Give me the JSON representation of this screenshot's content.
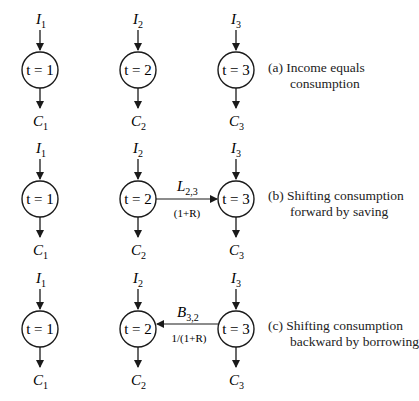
{
  "diagram": {
    "colors": {
      "stroke": "#1a1a1a",
      "background": "#ffffff"
    },
    "panels": [
      {
        "id": "a",
        "caption_line1": "(a) Income equals",
        "caption_line2": "consumption",
        "nodes": [
          {
            "income": "I",
            "income_sub": "1",
            "period": "t = 1",
            "consumption": "C",
            "consumption_sub": "1"
          },
          {
            "income": "I",
            "income_sub": "2",
            "period": "t = 2",
            "consumption": "C",
            "consumption_sub": "2"
          },
          {
            "income": "I",
            "income_sub": "3",
            "period": "t = 3",
            "consumption": "C",
            "consumption_sub": "3"
          }
        ]
      },
      {
        "id": "b",
        "caption_line1": "(b) Shifting consumption",
        "caption_line2": "forward by saving",
        "nodes": [
          {
            "income": "I",
            "income_sub": "1",
            "period": "t = 1",
            "consumption": "C",
            "consumption_sub": "1"
          },
          {
            "income": "I",
            "income_sub": "2",
            "period": "t = 2",
            "consumption": "C",
            "consumption_sub": "2"
          },
          {
            "income": "I",
            "income_sub": "3",
            "period": "t = 3",
            "consumption": "C",
            "consumption_sub": "3"
          }
        ],
        "edge": {
          "from": "t=2",
          "to": "t=3",
          "label": "L",
          "label_sub": "2,3",
          "factor": "(1+R)"
        }
      },
      {
        "id": "c",
        "caption_line1": "(c) Shifting consumption",
        "caption_line2": "backward by borrowing",
        "nodes": [
          {
            "income": "I",
            "income_sub": "1",
            "period": "t = 1",
            "consumption": "C",
            "consumption_sub": "1"
          },
          {
            "income": "I",
            "income_sub": "2",
            "period": "t = 2",
            "consumption": "C",
            "consumption_sub": "2"
          },
          {
            "income": "I",
            "income_sub": "3",
            "period": "t = 3",
            "consumption": "C",
            "consumption_sub": "3"
          }
        ],
        "edge": {
          "from": "t=3",
          "to": "t=2",
          "label": "B",
          "label_sub": "3,2",
          "factor": "1/(1+R)"
        }
      }
    ]
  }
}
